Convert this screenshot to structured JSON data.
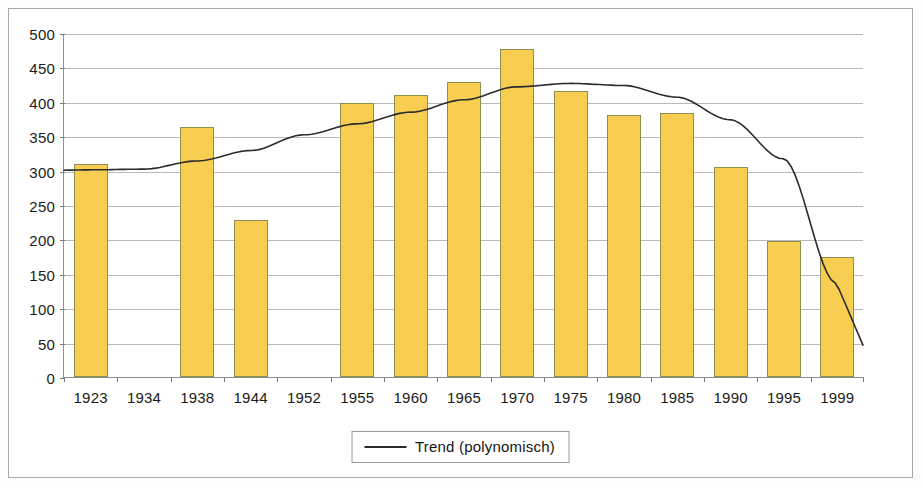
{
  "chart_data": {
    "type": "bar",
    "title": "",
    "subtitle": "",
    "xlabel": "",
    "ylabel": "",
    "ylim": [
      0,
      500
    ],
    "ytick_step": 50,
    "yticks": [
      0,
      50,
      100,
      150,
      200,
      250,
      300,
      350,
      400,
      450,
      500
    ],
    "grid": true,
    "legend_position": "bottom-center",
    "categories": [
      "1923",
      "1934",
      "1938",
      "1944",
      "1952",
      "1955",
      "1960",
      "1965",
      "1970",
      "1975",
      "1980",
      "1985",
      "1990",
      "1995",
      "1999"
    ],
    "values": [
      309,
      null,
      363,
      228,
      null,
      399,
      410,
      429,
      477,
      416,
      381,
      384,
      305,
      197,
      174
    ],
    "bar_color": "#f7ce52",
    "bar_border_color": "#8d8d4f",
    "series": [
      {
        "name": "Trend (polynomisch)",
        "type": "line",
        "color": "#2b2b2b",
        "values": [
          302,
          303,
          315,
          330,
          353,
          369,
          386,
          404,
          423,
          428,
          425,
          408,
          375,
          318,
          137
        ]
      }
    ],
    "legend": [
      "Trend (polynomisch)"
    ]
  },
  "legend": {
    "label": "Trend (polynomisch)",
    "line_icon": "line-sample-icon"
  },
  "axis": {
    "y_labels": [
      "500",
      "450",
      "400",
      "350",
      "300",
      "250",
      "200",
      "150",
      "100",
      "50",
      "0"
    ],
    "x_labels": [
      "1923",
      "1934",
      "1938",
      "1944",
      "1952",
      "1955",
      "1960",
      "1965",
      "1970",
      "1975",
      "1980",
      "1985",
      "1990",
      "1995",
      "1999"
    ]
  },
  "colors": {
    "bar_fill": "#f7ce52",
    "bar_stroke": "#8d8d4f",
    "grid": "#b9b9b9",
    "axis": "#8c8c8c",
    "trend": "#2b2b2b",
    "frame": "#a8a8a8",
    "background": "#ffffff"
  }
}
